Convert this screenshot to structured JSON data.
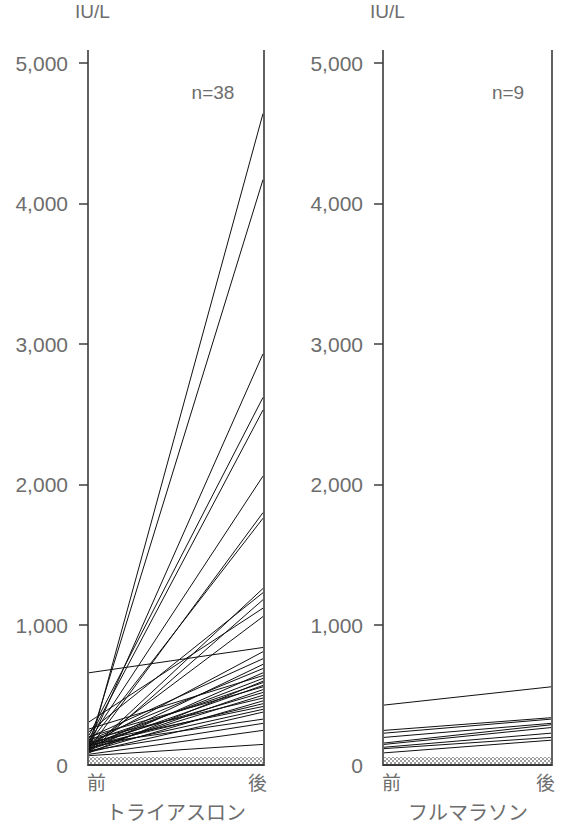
{
  "figure": {
    "unit_label": "IU/L",
    "bottom_caption": ""
  },
  "axis": {
    "y_ticks": [
      {
        "value": 5000,
        "label": "5,000"
      },
      {
        "value": 4000,
        "label": "4,000"
      },
      {
        "value": 3000,
        "label": "3,000"
      },
      {
        "value": 2000,
        "label": "2,000"
      },
      {
        "value": 1000,
        "label": "1,000"
      },
      {
        "value": 0,
        "label": "0"
      }
    ],
    "y_min": 0,
    "y_max": 5000,
    "x_tick_labels": [
      "前",
      "後"
    ],
    "reference_band": {
      "low": 0,
      "high": 60,
      "color": "#c8c8c8"
    }
  },
  "panels": [
    {
      "id": "triathlon",
      "caption": "トライアスロン",
      "n_label": "n=38",
      "unit_label": "IU/L",
      "x_before_label": "前",
      "x_after_label": "後"
    },
    {
      "id": "full-marathon",
      "caption": "フルマラソン",
      "n_label": "n=9",
      "unit_label": "IU/L",
      "x_before_label": "前",
      "x_after_label": "後"
    }
  ],
  "chart_data": {
    "type": "line",
    "title": "",
    "subtitle": "",
    "xlabel": "",
    "ylabel": "IU/L",
    "ylim": [
      0,
      5000
    ],
    "grid": false,
    "legend": "none",
    "x": [
      "前",
      "後"
    ],
    "x_tick_labels": [
      "前",
      "後"
    ],
    "y_tick_labels": [
      "0",
      "1,000",
      "2,000",
      "3,000",
      "4,000",
      "5,000"
    ],
    "annotations": [
      "n=38",
      "n=9",
      "IU/L"
    ],
    "panels": [
      {
        "name": "トライアスロン",
        "n": 38,
        "annotation": "n=38",
        "pairs": [
          [
            110,
            4640
          ],
          [
            150,
            4170
          ],
          [
            135,
            2930
          ],
          [
            215,
            2620
          ],
          [
            190,
            2530
          ],
          [
            175,
            2060
          ],
          [
            120,
            1800
          ],
          [
            160,
            1760
          ],
          [
            105,
            1260
          ],
          [
            240,
            1230
          ],
          [
            95,
            1180
          ],
          [
            310,
            1120
          ],
          [
            130,
            1060
          ],
          [
            660,
            840
          ],
          [
            150,
            810
          ],
          [
            200,
            760
          ],
          [
            125,
            720
          ],
          [
            180,
            690
          ],
          [
            115,
            660
          ],
          [
            260,
            640
          ],
          [
            145,
            620
          ],
          [
            90,
            600
          ],
          [
            170,
            590
          ],
          [
            135,
            570
          ],
          [
            205,
            560
          ],
          [
            110,
            540
          ],
          [
            155,
            520
          ],
          [
            120,
            500
          ],
          [
            185,
            480
          ],
          [
            100,
            460
          ],
          [
            140,
            440
          ],
          [
            165,
            420
          ],
          [
            125,
            400
          ],
          [
            95,
            380
          ],
          [
            150,
            330
          ],
          [
            105,
            300
          ],
          [
            80,
            250
          ],
          [
            70,
            150
          ]
        ]
      },
      {
        "name": "フルマラソン",
        "n": 9,
        "annotation": "n=9",
        "pairs": [
          [
            430,
            560
          ],
          [
            250,
            340
          ],
          [
            230,
            330
          ],
          [
            200,
            300
          ],
          [
            160,
            290
          ],
          [
            150,
            270
          ],
          [
            130,
            230
          ],
          [
            120,
            200
          ],
          [
            90,
            180
          ]
        ]
      }
    ]
  }
}
